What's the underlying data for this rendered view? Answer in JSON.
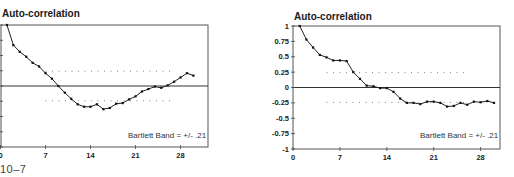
{
  "caption": "10–7",
  "chart_data": [
    {
      "type": "line",
      "title": "Auto-correlation",
      "xlabel": "",
      "ylabel": "",
      "x": [
        1,
        2,
        3,
        4,
        5,
        6,
        7,
        8,
        9,
        10,
        11,
        12,
        13,
        14,
        15,
        16,
        17,
        18,
        19,
        20,
        21,
        22,
        23,
        24,
        25,
        26,
        27,
        28,
        29,
        30
      ],
      "series": [
        {
          "name": "Auto-correlation",
          "values": [
            1.0,
            0.67,
            0.56,
            0.48,
            0.38,
            0.32,
            0.21,
            0.12,
            0.0,
            -0.11,
            -0.21,
            -0.3,
            -0.34,
            -0.34,
            -0.3,
            -0.38,
            -0.36,
            -0.29,
            -0.28,
            -0.22,
            -0.17,
            -0.09,
            -0.05,
            -0.01,
            -0.03,
            0.01,
            0.07,
            0.14,
            0.21,
            0.17
          ]
        }
      ],
      "bartlett_band": 0.21,
      "band_label": "Bartlett Band = +/- .21",
      "xticks": [
        "0",
        "7",
        "14",
        "21",
        "28"
      ],
      "xtick_values": [
        0,
        7,
        14,
        21,
        28
      ],
      "yticks": [],
      "xlim": [
        0,
        32
      ],
      "ylim": [
        -1,
        1
      ],
      "grid": false,
      "zero_line": true,
      "band_extent": [
        7,
        27
      ]
    },
    {
      "type": "line",
      "title": "Auto-correlation",
      "xlabel": "",
      "ylabel": "",
      "x": [
        1,
        2,
        3,
        4,
        5,
        6,
        7,
        8,
        9,
        10,
        11,
        12,
        13,
        14,
        15,
        16,
        17,
        18,
        19,
        20,
        21,
        22,
        23,
        24,
        25,
        26,
        27,
        28,
        29,
        30
      ],
      "series": [
        {
          "name": "Auto-correlation",
          "values": [
            1.0,
            0.78,
            0.65,
            0.53,
            0.49,
            0.44,
            0.44,
            0.43,
            0.25,
            0.14,
            0.03,
            0.02,
            -0.01,
            -0.01,
            -0.07,
            -0.18,
            -0.25,
            -0.25,
            -0.27,
            -0.23,
            -0.23,
            -0.25,
            -0.31,
            -0.3,
            -0.25,
            -0.28,
            -0.23,
            -0.24,
            -0.22,
            -0.25
          ]
        }
      ],
      "bartlett_band": 0.21,
      "band_label": "Bartlett Band = +/- .21",
      "xticks": [
        "0",
        "7",
        "14",
        "21",
        "28"
      ],
      "xtick_values": [
        0,
        7,
        14,
        21,
        28
      ],
      "yticks": [
        "1",
        "0.75",
        "0.5",
        "0.25",
        "0",
        "-0.25",
        "-0.5",
        "-0.75",
        "-1"
      ],
      "ytick_values": [
        1,
        0.75,
        0.5,
        0.25,
        0,
        -0.25,
        -0.5,
        -0.75,
        -1
      ],
      "xlim": [
        0,
        31
      ],
      "ylim": [
        -1,
        1
      ],
      "grid": false,
      "zero_line": true,
      "band_extent": [
        5,
        26
      ]
    }
  ]
}
